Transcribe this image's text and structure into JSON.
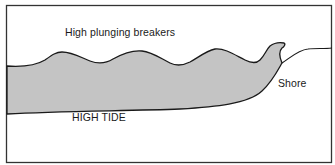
{
  "diagram": {
    "title": "",
    "labels": {
      "breakers": "High plunging breakers",
      "shore": "Shore",
      "tide": "HIGH TIDE"
    },
    "colors": {
      "water_fill": "#c4c4c4",
      "outline": "#1a1a1a",
      "background": "#ffffff",
      "frame": "#333333"
    },
    "elements": [
      {
        "type": "frame",
        "name": "diagram-border"
      },
      {
        "type": "water-body",
        "name": "breaking-waves",
        "waves": 4
      },
      {
        "type": "line",
        "name": "shore-profile"
      },
      {
        "type": "line",
        "name": "high-tide-seabed"
      }
    ]
  }
}
